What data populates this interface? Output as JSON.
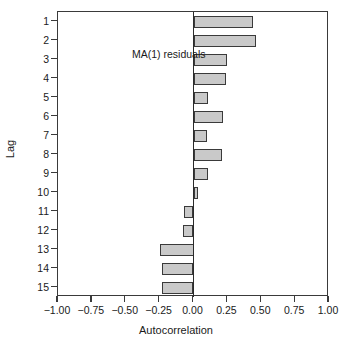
{
  "chart_data": {
    "type": "bar",
    "orientation": "horizontal",
    "title": "",
    "xlabel": "Autocorrelation",
    "ylabel": "Lag",
    "xlim": [
      -1.0,
      1.0
    ],
    "grid": false,
    "legend": null,
    "annotations": [
      {
        "text": "MA(1) residuals",
        "x": -0.62,
        "y": 2
      }
    ],
    "xticks": [
      -1.0,
      -0.75,
      -0.5,
      -0.25,
      0.0,
      0.25,
      0.5,
      0.75,
      1.0
    ],
    "xtick_labels": [
      "−1.00",
      "−0.75",
      "−0.50",
      "−0.25",
      "0.00",
      "0.25",
      "0.50",
      "0.75",
      "1.00"
    ],
    "categories": [
      "1",
      "2",
      "3",
      "4",
      "5",
      "6",
      "7",
      "8",
      "9",
      "10",
      "11",
      "12",
      "13",
      "14",
      "15"
    ],
    "values": [
      0.44,
      0.46,
      0.25,
      0.24,
      0.11,
      0.22,
      0.1,
      0.21,
      0.11,
      0.03,
      -0.07,
      -0.08,
      -0.25,
      -0.23,
      -0.23
    ],
    "bar_fill_color": "#c9c9c9",
    "bar_edge_color": "#3a3a3a",
    "axis_color": "#3a3a3a",
    "zero_line_color": "#2b2b2b",
    "background_color": "#ffffff"
  }
}
